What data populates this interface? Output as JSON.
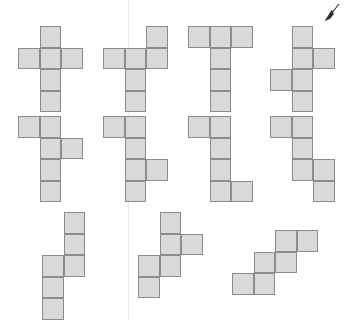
{
  "figure": {
    "title": "",
    "cell_size": 21.5,
    "cell_fill": "#d9d9d9",
    "cell_stroke": "#8c8c8c",
    "background": "#ffffff",
    "divider": {
      "name": "vertical-guide-line",
      "x": 128,
      "y": 0,
      "height": 319,
      "color": "#eceaf0"
    },
    "cursor": {
      "name": "mouse-cursor",
      "x": 320,
      "y": 2,
      "color": "#2b2b2b",
      "direction": "down-left"
    },
    "shapes": [
      {
        "id": "net-1",
        "label": "plus-cross-net",
        "x": 18,
        "y": 26,
        "cells": [
          [
            1,
            0
          ],
          [
            0,
            1
          ],
          [
            1,
            1
          ],
          [
            2,
            1
          ],
          [
            1,
            2
          ],
          [
            1,
            3
          ]
        ]
      },
      {
        "id": "net-2",
        "label": "offset-cross-net",
        "x": 103,
        "y": 26,
        "cells": [
          [
            2,
            0
          ],
          [
            0,
            1
          ],
          [
            1,
            1
          ],
          [
            2,
            1
          ],
          [
            1,
            2
          ],
          [
            1,
            3
          ]
        ]
      },
      {
        "id": "net-3",
        "label": "tee-net",
        "x": 188,
        "y": 26,
        "cells": [
          [
            0,
            0
          ],
          [
            1,
            0
          ],
          [
            2,
            0
          ],
          [
            1,
            1
          ],
          [
            1,
            2
          ],
          [
            1,
            3
          ]
        ]
      },
      {
        "id": "net-4",
        "label": "zigzag-cross-net",
        "x": 270,
        "y": 26,
        "cells": [
          [
            1,
            0
          ],
          [
            1,
            1
          ],
          [
            2,
            1
          ],
          [
            0,
            2
          ],
          [
            1,
            2
          ],
          [
            1,
            3
          ]
        ]
      },
      {
        "id": "net-5",
        "label": "stepped-net-top",
        "x": 18,
        "y": 116,
        "cells": [
          [
            0,
            0
          ],
          [
            1,
            0
          ],
          [
            1,
            1
          ],
          [
            2,
            1
          ],
          [
            1,
            2
          ],
          [
            1,
            3
          ]
        ]
      },
      {
        "id": "net-6",
        "label": "stepped-net-middle",
        "x": 103,
        "y": 116,
        "cells": [
          [
            0,
            0
          ],
          [
            1,
            0
          ],
          [
            1,
            1
          ],
          [
            1,
            2
          ],
          [
            2,
            2
          ],
          [
            1,
            3
          ]
        ]
      },
      {
        "id": "net-7",
        "label": "zed-net",
        "x": 188,
        "y": 116,
        "cells": [
          [
            0,
            0
          ],
          [
            1,
            0
          ],
          [
            1,
            1
          ],
          [
            1,
            2
          ],
          [
            1,
            3
          ],
          [
            2,
            3
          ]
        ]
      },
      {
        "id": "net-8",
        "label": "double-step-net",
        "x": 270,
        "y": 116,
        "cells": [
          [
            0,
            0
          ],
          [
            1,
            0
          ],
          [
            1,
            1
          ],
          [
            1,
            2
          ],
          [
            2,
            2
          ],
          [
            2,
            3
          ]
        ]
      },
      {
        "id": "net-9",
        "label": "long-offset-net",
        "x": 42,
        "y": 212,
        "cells": [
          [
            1,
            0
          ],
          [
            1,
            1
          ],
          [
            0,
            2
          ],
          [
            1,
            2
          ],
          [
            0,
            3
          ],
          [
            0,
            4
          ]
        ]
      },
      {
        "id": "net-10",
        "label": "diagonal-branch-net",
        "x": 138,
        "y": 212,
        "cells": [
          [
            1,
            0
          ],
          [
            1,
            1
          ],
          [
            2,
            1
          ],
          [
            0,
            2
          ],
          [
            1,
            2
          ],
          [
            0,
            3
          ]
        ]
      },
      {
        "id": "net-11",
        "label": "staircase-net",
        "x": 232,
        "y": 230,
        "cells": [
          [
            2,
            0
          ],
          [
            3,
            0
          ],
          [
            1,
            1
          ],
          [
            2,
            1
          ],
          [
            0,
            2
          ],
          [
            1,
            2
          ]
        ]
      }
    ]
  }
}
